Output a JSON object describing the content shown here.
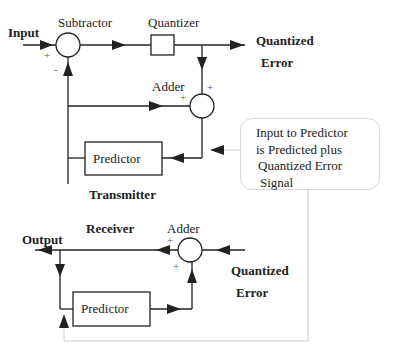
{
  "diagram": {
    "transmitter": {
      "section_label": "Transmitter",
      "input_label": "Input",
      "subtractor_label": "Subtractor",
      "subtractor_plus": "+",
      "subtractor_minus": "-",
      "quantizer_label": "Quantizer",
      "output_label_line1": "Quantized",
      "output_label_line2": "Error",
      "adder_label": "Adder",
      "adder_plus_left": "+",
      "adder_plus_top": "+",
      "predictor_label": "Predictor"
    },
    "callout": {
      "line1": "Input to Predictor",
      "line2": "is Predicted plus",
      "line3": "Quantized Error",
      "line4": "Signal"
    },
    "receiver": {
      "section_label": "Receiver",
      "output_label": "Output",
      "adder_label": "Adder",
      "adder_plus_left": "+",
      "adder_plus_bottom": "+",
      "input_label_line1": "Quantized",
      "input_label_line2": "Error",
      "predictor_label": "Predictor"
    },
    "colors": {
      "line": "#222222",
      "callout_border": "#d8d8d8",
      "connector": "#cccccc"
    }
  }
}
